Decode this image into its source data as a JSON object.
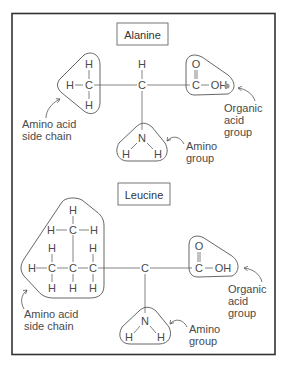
{
  "figure": {
    "frame_color": "#333333",
    "text_color": "#4a4a4a",
    "panels": [
      {
        "title": "Alanine",
        "labels": {
          "side_chain": [
            "Amino acid",
            "side chain"
          ],
          "amino": [
            "Amino",
            "group"
          ],
          "acid": [
            "Organic",
            "acid",
            "group"
          ]
        },
        "atoms": {
          "alpha_c": "C",
          "alpha_h": "H",
          "side_c": "C",
          "side_h_top": "H",
          "side_h_left": "H",
          "side_h_bottom": "H",
          "acid_c": "C",
          "acid_o": "O",
          "acid_oh": "OH",
          "n": "N",
          "nh_left": "H",
          "nh_right": "H"
        }
      },
      {
        "title": "Leucine",
        "labels": {
          "side_chain": [
            "Amino acid",
            "side chain"
          ],
          "amino": [
            "Amino",
            "group"
          ],
          "acid": [
            "Organic",
            "acid",
            "group"
          ]
        },
        "atoms": {
          "alpha_c": "C",
          "c1": "C",
          "c2": "C",
          "c3": "C",
          "c_top": "C",
          "h_top": "H",
          "h_top_left": "H",
          "h_top_right": "H",
          "h_left": "H",
          "c1_h_up": "H",
          "c1_h_down": "H",
          "c2_h_down": "H",
          "c3_h_up": "H",
          "c3_h_down": "H",
          "acid_c": "C",
          "acid_o": "O",
          "acid_oh": "OH",
          "n": "N",
          "nh_left": "H",
          "nh_right": "H"
        }
      }
    ]
  }
}
